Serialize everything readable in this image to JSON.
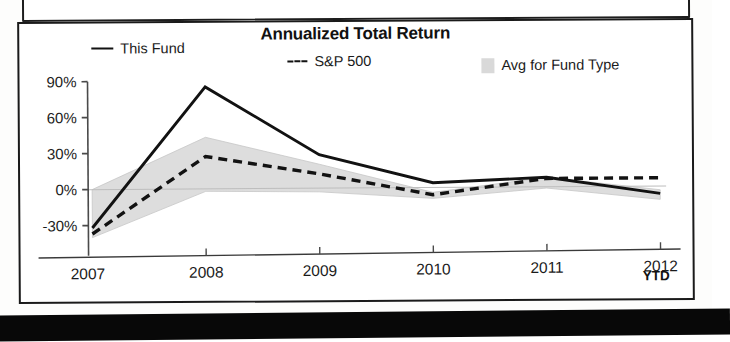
{
  "chart_data": {
    "type": "line",
    "title": "Annualized Total Return",
    "xlabel": "",
    "ylabel": "",
    "categories": [
      "2007",
      "2008",
      "2009",
      "2010",
      "2011",
      "2012"
    ],
    "x_tick_labels": [
      "2007",
      "2008",
      "2009",
      "2010",
      "2011",
      "2012"
    ],
    "x_axis_note": "YTD",
    "y_tick_labels": [
      "90%",
      "60%",
      "30%",
      "0%",
      "-30%"
    ],
    "y_ticks": [
      90,
      60,
      30,
      0,
      -30
    ],
    "ylim": [
      -45,
      95
    ],
    "grid": false,
    "legend_position": "top",
    "series": [
      {
        "name": "This Fund",
        "style": "solid",
        "color": "#121212",
        "values": [
          -32,
          85,
          28,
          4,
          8,
          -6
        ]
      },
      {
        "name": "S&P 500",
        "style": "dashed",
        "color": "#121212",
        "values": [
          -37,
          27,
          12,
          -6,
          7,
          7
        ]
      },
      {
        "name": "Avg for Fund Type",
        "style": "band",
        "color": "#d9d9d9",
        "upper": [
          0,
          43,
          20,
          -4,
          8,
          -3
        ],
        "lower": [
          -40,
          -2,
          -3,
          -9,
          -1,
          -11
        ]
      }
    ]
  },
  "chart": {
    "title": "Annualized Total Return",
    "ytd_label": "YTD",
    "legend": [
      {
        "label": "This Fund",
        "marker": "solid-line-swatch"
      },
      {
        "label": "S&P 500",
        "marker": "dashed-line-swatch"
      },
      {
        "label": "Avg for Fund Type",
        "marker": "filled-square-swatch"
      }
    ],
    "y_labels": [
      "90%",
      "60%",
      "30%",
      "0%",
      "-30%"
    ],
    "x_labels": [
      "2007",
      "2008",
      "2009",
      "2010",
      "2011",
      "2012"
    ]
  }
}
